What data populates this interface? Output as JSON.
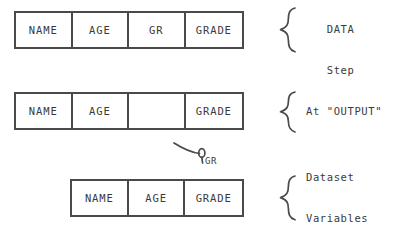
{
  "diagram": {
    "stroke_color": "#4a4a4a",
    "text_color": "#3a3a3a",
    "background_color": "#ffffff",
    "rows": [
      {
        "id": "datastep",
        "name": "during-data-step-pdv",
        "cells": [
          {
            "label": "NAME",
            "empty": false
          },
          {
            "label": "AGE",
            "empty": false
          },
          {
            "label": "GR",
            "empty": false
          },
          {
            "label": "GRADE",
            "empty": false
          }
        ],
        "caption_lines": [
          "During the",
          "DATA",
          "Step"
        ]
      },
      {
        "id": "output",
        "name": "at-output-pdv",
        "cells": [
          {
            "label": "NAME",
            "empty": false
          },
          {
            "label": "AGE",
            "empty": false
          },
          {
            "label": "",
            "empty": true
          },
          {
            "label": "GRADE",
            "empty": false
          }
        ],
        "caption_lines": [
          "At \"OUTPUT\""
        ]
      },
      {
        "id": "dataset",
        "name": "dataset-variables-pdv",
        "cells": [
          {
            "label": "NAME",
            "empty": false
          },
          {
            "label": "AGE",
            "empty": false
          },
          {
            "label": "GRADE",
            "empty": false
          }
        ],
        "caption_lines": [
          "Dataset",
          "Variables"
        ]
      }
    ],
    "callout": {
      "name": "dropped-variable-callout",
      "label": "GR"
    }
  }
}
